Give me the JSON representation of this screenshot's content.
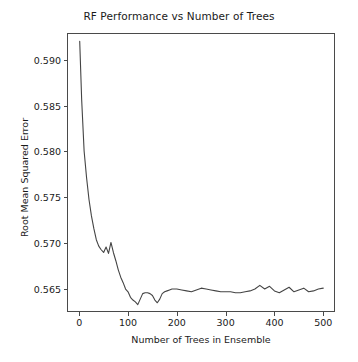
{
  "chart_data": {
    "type": "line",
    "title": "RF Performance vs Number of Trees",
    "xlabel": "Number of Trees in Ensemble",
    "ylabel": "Root Mean Squared Error",
    "xlim": [
      -23,
      522
    ],
    "ylim": [
      0.56255,
      0.59285
    ],
    "grid": false,
    "legend": null,
    "line_color": "#444444",
    "line_width": 1.1,
    "xticks": [
      0,
      100,
      200,
      300,
      400,
      500
    ],
    "xtick_labels": [
      "0",
      "100",
      "200",
      "300",
      "400",
      "500"
    ],
    "yticks": [
      0.565,
      0.57,
      0.575,
      0.58,
      0.585,
      0.59
    ],
    "ytick_labels": [
      "0.565",
      "0.570",
      "0.575",
      "0.580",
      "0.585",
      "0.590"
    ],
    "series": [
      {
        "name": "RMSE",
        "x": [
          1,
          5,
          10,
          15,
          20,
          25,
          30,
          35,
          40,
          45,
          50,
          55,
          60,
          65,
          70,
          75,
          80,
          85,
          90,
          95,
          100,
          105,
          110,
          115,
          120,
          125,
          130,
          135,
          140,
          145,
          150,
          155,
          160,
          165,
          170,
          175,
          180,
          185,
          190,
          195,
          200,
          210,
          220,
          230,
          240,
          250,
          260,
          270,
          280,
          290,
          300,
          310,
          320,
          330,
          340,
          350,
          360,
          370,
          380,
          390,
          400,
          410,
          420,
          430,
          440,
          450,
          460,
          470,
          480,
          490,
          500
        ],
        "values": [
          0.59205,
          0.58565,
          0.58005,
          0.57715,
          0.57475,
          0.57295,
          0.57155,
          0.57035,
          0.56965,
          0.56925,
          0.56895,
          0.56955,
          0.56885,
          0.57005,
          0.56895,
          0.56805,
          0.56705,
          0.56625,
          0.56565,
          0.56495,
          0.56465,
          0.56405,
          0.56375,
          0.56355,
          0.56325,
          0.56385,
          0.56445,
          0.56455,
          0.56455,
          0.56445,
          0.56425,
          0.56375,
          0.56345,
          0.56385,
          0.56445,
          0.56465,
          0.56475,
          0.56485,
          0.56495,
          0.56495,
          0.56495,
          0.56485,
          0.56475,
          0.56465,
          0.56485,
          0.56505,
          0.56495,
          0.56485,
          0.56475,
          0.56465,
          0.56465,
          0.56465,
          0.56455,
          0.56455,
          0.56465,
          0.56475,
          0.56495,
          0.56535,
          0.56495,
          0.56525,
          0.56475,
          0.56455,
          0.56485,
          0.56515,
          0.56465,
          0.56485,
          0.56505,
          0.56465,
          0.56475,
          0.56495,
          0.56505
        ]
      }
    ]
  }
}
